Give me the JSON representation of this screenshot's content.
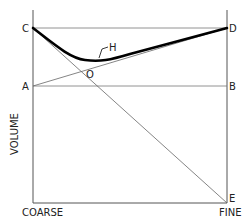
{
  "diagram": {
    "type": "geometric-line-diagram",
    "axes": {
      "y_label": "VOLUME",
      "x_start_label": "COARSE",
      "x_end_label": "FINE"
    },
    "points": {
      "C": "C",
      "D": "D",
      "A": "A",
      "B": "B",
      "E": "E",
      "O": "O",
      "H": "H"
    },
    "lines": [
      {
        "from": "C",
        "to": "D",
        "style": "thin"
      },
      {
        "from": "A",
        "to": "B",
        "style": "thin"
      },
      {
        "from": "C",
        "to": "E",
        "style": "thin"
      },
      {
        "from": "A",
        "to": "D",
        "style": "thin"
      },
      {
        "from": "C",
        "to": "D",
        "via": "H",
        "style": "thick-curve"
      }
    ],
    "colors": {
      "line": "#555555",
      "curve": "#000000",
      "text": "#222222"
    }
  }
}
